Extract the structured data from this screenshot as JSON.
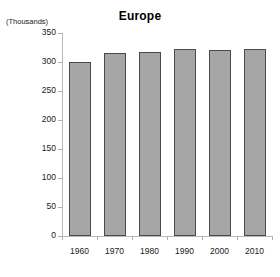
{
  "chart_data": {
    "type": "bar",
    "title": "Europe",
    "unit_caption": "(Thousands)",
    "xlabel": "",
    "ylabel": "",
    "categories": [
      "1960",
      "1970",
      "1980",
      "1990",
      "2000",
      "2010"
    ],
    "values": [
      300,
      315,
      317,
      323,
      320,
      322
    ],
    "ylim": [
      0,
      350
    ],
    "yticks": [
      0,
      50,
      100,
      150,
      200,
      250,
      300,
      350
    ],
    "ytick_labels": [
      "0",
      "50",
      "100",
      "150",
      "200",
      "250",
      "300",
      "350"
    ],
    "grid": false,
    "legend": null,
    "bar_color": "#a6a6a6",
    "bar_border_color": "#4a4a4a",
    "axis_color": "#b9b9b9",
    "text_color": "#1a1a1a",
    "background": "#ffffff"
  }
}
